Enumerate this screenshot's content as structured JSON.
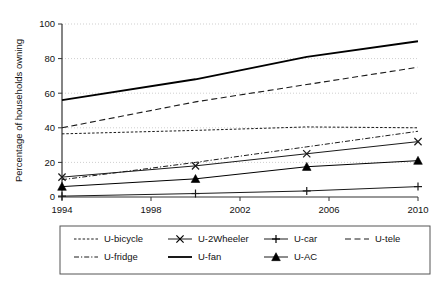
{
  "chart_data": {
    "type": "line",
    "title": "",
    "xlabel": "",
    "ylabel": "Percentage of households owning",
    "xlim": [
      1994,
      2010
    ],
    "ylim": [
      0,
      100
    ],
    "grid": true,
    "grid_axis": "y",
    "legend_position": "bottom",
    "legend_columns": 4,
    "x": [
      1994,
      2000,
      2005,
      2010
    ],
    "xticks": [
      "1994",
      "1998",
      "2002",
      "2006",
      "2010"
    ],
    "xtick_values": [
      1994,
      1998,
      2002,
      2006,
      2010
    ],
    "yticks": [
      "0",
      "20",
      "40",
      "60",
      "80",
      "100"
    ],
    "ytick_values": [
      0,
      20,
      40,
      60,
      80,
      100
    ],
    "series": [
      {
        "name": "U-bicycle",
        "style": "dotted",
        "marker": "none",
        "color": "#1a1a1a",
        "x": [
          1994,
          2000,
          2005,
          2010
        ],
        "values": [
          36.5,
          38.5,
          40.5,
          40.0
        ]
      },
      {
        "name": "U-2Wheeler",
        "style": "solid",
        "marker": "x",
        "color": "#1a1a1a",
        "x": [
          1994,
          2000,
          2005,
          2010
        ],
        "values": [
          11.5,
          18.0,
          25.0,
          32.0
        ]
      },
      {
        "name": "U-car",
        "style": "solid",
        "marker": "plus",
        "color": "#1a1a1a",
        "x": [
          1994,
          2000,
          2005,
          2010
        ],
        "values": [
          0.5,
          2.0,
          3.5,
          6.0
        ]
      },
      {
        "name": "U-tele",
        "style": "dashed",
        "marker": "none",
        "color": "#1a1a1a",
        "x": [
          1994,
          2000,
          2005,
          2010
        ],
        "values": [
          40.0,
          55.0,
          65.0,
          75.0
        ]
      },
      {
        "name": "U-fridge",
        "style": "dashdot",
        "marker": "none",
        "color": "#1a1a1a",
        "x": [
          1994,
          2000,
          2005,
          2010
        ],
        "values": [
          10.0,
          20.0,
          29.0,
          38.0
        ]
      },
      {
        "name": "U-fan",
        "style": "solid-thick",
        "marker": "none",
        "color": "#000000",
        "x": [
          1994,
          2000,
          2005,
          2010
        ],
        "values": [
          56.0,
          68.0,
          81.0,
          90.0
        ]
      },
      {
        "name": "U-AC",
        "style": "solid",
        "marker": "triangle",
        "color": "#000000",
        "x": [
          1994,
          2000,
          2005,
          2010
        ],
        "values": [
          6.0,
          10.5,
          17.5,
          21.0
        ]
      }
    ]
  },
  "axis": {
    "ylabel": "Percentage of households owning",
    "ytick_labels": [
      "100",
      "80",
      "60",
      "40",
      "20",
      "0"
    ],
    "xtick_labels": [
      "1994",
      "1998",
      "2002",
      "2006",
      "2010"
    ]
  },
  "legend": {
    "entries": [
      {
        "label": "U-bicycle",
        "style": "dotted",
        "marker": "none"
      },
      {
        "label": "U-2Wheeler",
        "style": "solid",
        "marker": "x"
      },
      {
        "label": "U-car",
        "style": "solid",
        "marker": "plus"
      },
      {
        "label": "U-tele",
        "style": "dashed",
        "marker": "none"
      },
      {
        "label": "U-fridge",
        "style": "dashdot",
        "marker": "none"
      },
      {
        "label": "U-fan",
        "style": "solid-thick",
        "marker": "none"
      },
      {
        "label": "U-AC",
        "style": "solid",
        "marker": "triangle"
      }
    ]
  },
  "colors": {
    "ink": "#1a1a1a",
    "grid": "#cfcfcf",
    "axis": "#333333",
    "background": "#ffffff",
    "legend_border": "#555555"
  }
}
